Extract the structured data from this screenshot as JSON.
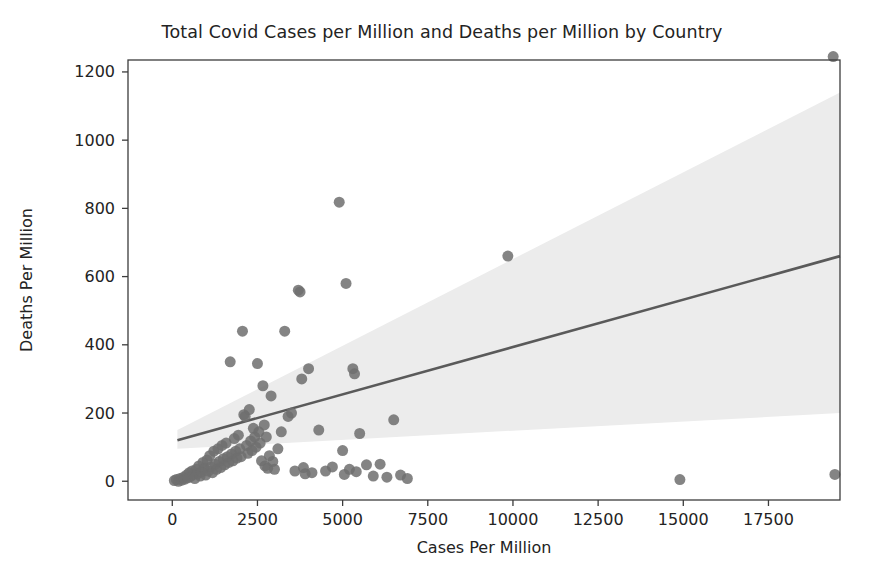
{
  "chart_data": {
    "type": "scatter",
    "title": "Total Covid Cases per Million and Deaths per Million by Country",
    "xlabel": "Cases Per Million",
    "ylabel": "Deaths Per Million",
    "xlim": [
      -1300,
      19600
    ],
    "ylim": [
      -55,
      1235
    ],
    "xticks": [
      0,
      2500,
      5000,
      7500,
      10000,
      12500,
      15000,
      17500
    ],
    "xtick_labels": [
      "0",
      "2500",
      "5000",
      "7500",
      "10000",
      "12500",
      "15000",
      "17500"
    ],
    "yticks": [
      0,
      200,
      400,
      600,
      800,
      1000,
      1200
    ],
    "ytick_labels": [
      "0",
      "200",
      "400",
      "600",
      "800",
      "1000",
      "1200"
    ],
    "grid": false,
    "legend": null,
    "marker": {
      "shape": "circle",
      "color": "#6e6e6e",
      "size_px": 11,
      "opacity": 0.85
    },
    "regression": {
      "label": "linear fit with 95% confidence interval",
      "line_color": "#5a5a5a",
      "band_color": "#ececec",
      "x_start": 150,
      "x_end": 19600,
      "y_start": 120,
      "y_end": 660,
      "band_lower_start": 95,
      "band_lower_end": 200,
      "band_upper_start": 150,
      "band_upper_end": 1140
    },
    "series": [
      {
        "name": "Countries",
        "points": [
          [
            60,
            2
          ],
          [
            120,
            5
          ],
          [
            180,
            0
          ],
          [
            230,
            8
          ],
          [
            280,
            3
          ],
          [
            330,
            12
          ],
          [
            370,
            6
          ],
          [
            420,
            18
          ],
          [
            460,
            10
          ],
          [
            500,
            25
          ],
          [
            540,
            14
          ],
          [
            580,
            30
          ],
          [
            620,
            20
          ],
          [
            660,
            8
          ],
          [
            700,
            35
          ],
          [
            740,
            22
          ],
          [
            780,
            45
          ],
          [
            820,
            15
          ],
          [
            860,
            28
          ],
          [
            900,
            55
          ],
          [
            940,
            38
          ],
          [
            980,
            18
          ],
          [
            1020,
            62
          ],
          [
            1060,
            30
          ],
          [
            1100,
            75
          ],
          [
            1140,
            42
          ],
          [
            1180,
            25
          ],
          [
            1220,
            88
          ],
          [
            1260,
            50
          ],
          [
            1300,
            35
          ],
          [
            1340,
            95
          ],
          [
            1380,
            58
          ],
          [
            1420,
            40
          ],
          [
            1460,
            105
          ],
          [
            1500,
            66
          ],
          [
            1540,
            48
          ],
          [
            1580,
            112
          ],
          [
            1620,
            72
          ],
          [
            1660,
            55
          ],
          [
            1700,
            350
          ],
          [
            1740,
            80
          ],
          [
            1780,
            60
          ],
          [
            1820,
            125
          ],
          [
            1860,
            88
          ],
          [
            1900,
            68
          ],
          [
            1940,
            135
          ],
          [
            1980,
            95
          ],
          [
            2020,
            72
          ],
          [
            2060,
            440
          ],
          [
            2100,
            195
          ],
          [
            2140,
            190
          ],
          [
            2180,
            105
          ],
          [
            2220,
            82
          ],
          [
            2260,
            210
          ],
          [
            2300,
            118
          ],
          [
            2340,
            90
          ],
          [
            2380,
            155
          ],
          [
            2420,
            130
          ],
          [
            2460,
            100
          ],
          [
            2500,
            345
          ],
          [
            2540,
            145
          ],
          [
            2580,
            112
          ],
          [
            2620,
            60
          ],
          [
            2660,
            280
          ],
          [
            2700,
            165
          ],
          [
            2720,
            45
          ],
          [
            2760,
            130
          ],
          [
            2800,
            38
          ],
          [
            2850,
            75
          ],
          [
            2900,
            250
          ],
          [
            2950,
            58
          ],
          [
            3000,
            35
          ],
          [
            3100,
            95
          ],
          [
            3200,
            145
          ],
          [
            3300,
            440
          ],
          [
            3400,
            190
          ],
          [
            3500,
            200
          ],
          [
            3600,
            30
          ],
          [
            3700,
            560
          ],
          [
            3750,
            555
          ],
          [
            3800,
            300
          ],
          [
            3850,
            40
          ],
          [
            3900,
            22
          ],
          [
            4000,
            330
          ],
          [
            4100,
            25
          ],
          [
            4300,
            150
          ],
          [
            4500,
            30
          ],
          [
            4700,
            42
          ],
          [
            4900,
            818
          ],
          [
            5000,
            90
          ],
          [
            5050,
            20
          ],
          [
            5100,
            580
          ],
          [
            5200,
            35
          ],
          [
            5300,
            330
          ],
          [
            5350,
            315
          ],
          [
            5400,
            28
          ],
          [
            5500,
            140
          ],
          [
            5700,
            48
          ],
          [
            5900,
            15
          ],
          [
            6100,
            50
          ],
          [
            6300,
            12
          ],
          [
            6500,
            180
          ],
          [
            6700,
            18
          ],
          [
            6900,
            8
          ],
          [
            9850,
            660
          ],
          [
            14900,
            5
          ],
          [
            19400,
            1245
          ],
          [
            19450,
            20
          ]
        ]
      }
    ]
  },
  "figure": {
    "background": "#ffffff",
    "text_color": "#232323",
    "spine_color": "#3c3c3c"
  }
}
